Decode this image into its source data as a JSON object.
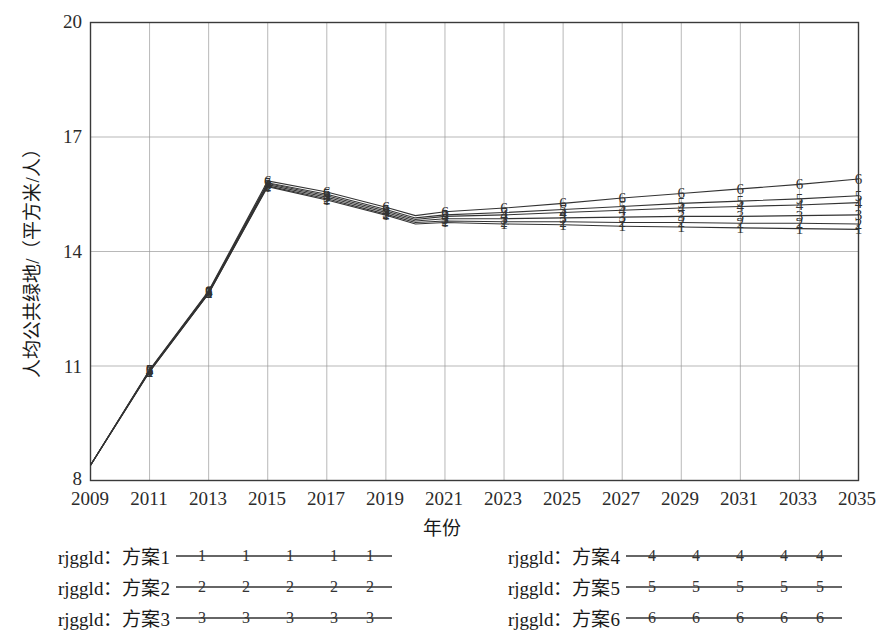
{
  "axes": {
    "ylabel": "人均公共绿地/（平方米/人）",
    "xlabel": "年份",
    "yticks": [
      "8",
      "11",
      "14",
      "17",
      "20"
    ],
    "xticks": [
      "2009",
      "2011",
      "2013",
      "2015",
      "2017",
      "2019",
      "2021",
      "2023",
      "2025",
      "2027",
      "2029",
      "2031",
      "2033",
      "2035"
    ]
  },
  "legend": {
    "left": [
      {
        "text": "rjggld：方案1",
        "marker": "1"
      },
      {
        "text": "rjggld：方案2",
        "marker": "2"
      },
      {
        "text": "rjggld：方案3",
        "marker": "3"
      }
    ],
    "right": [
      {
        "text": "rjggld：方案4",
        "marker": "4"
      },
      {
        "text": "rjggld：方案5",
        "marker": "5"
      },
      {
        "text": "rjggld：方案6",
        "marker": "6"
      }
    ]
  },
  "chart_data": {
    "type": "line",
    "title": "",
    "xlabel": "年份",
    "ylabel": "人均公共绿地/（平方米/人）",
    "xlim": [
      2009,
      2035
    ],
    "ylim": [
      8,
      20
    ],
    "yticks": [
      8,
      11,
      14,
      17,
      20
    ],
    "grid": true,
    "legend_position": "below",
    "marker_style": "series-number-glyph",
    "color": "#333333",
    "x": [
      2009,
      2011,
      2013,
      2015,
      2017,
      2019,
      2020,
      2021,
      2023,
      2025,
      2027,
      2029,
      2031,
      2033,
      2035
    ],
    "series": [
      {
        "name": "rjggld：方案1",
        "marker": "1",
        "values": [
          8.4,
          10.85,
          12.9,
          15.7,
          15.35,
          14.95,
          14.72,
          14.76,
          14.72,
          14.7,
          14.66,
          14.64,
          14.62,
          14.6,
          14.58
        ]
      },
      {
        "name": "rjggld：方案2",
        "marker": "2",
        "values": [
          8.4,
          10.85,
          12.9,
          15.72,
          15.38,
          14.98,
          14.76,
          14.8,
          14.78,
          14.78,
          14.76,
          14.76,
          14.74,
          14.74,
          14.72
        ]
      },
      {
        "name": "rjggld：方案3",
        "marker": "3",
        "values": [
          8.4,
          10.87,
          12.92,
          15.75,
          15.42,
          15.02,
          14.8,
          14.86,
          14.86,
          14.88,
          14.9,
          14.92,
          14.92,
          14.94,
          14.96
        ]
      },
      {
        "name": "rjggld：方案4",
        "marker": "4",
        "values": [
          8.4,
          10.88,
          12.94,
          15.78,
          15.46,
          15.06,
          14.84,
          14.92,
          14.96,
          15.02,
          15.08,
          15.14,
          15.18,
          15.22,
          15.28
        ]
      },
      {
        "name": "rjggld：方案5",
        "marker": "5",
        "values": [
          8.4,
          10.89,
          12.95,
          15.8,
          15.5,
          15.1,
          14.88,
          14.96,
          15.02,
          15.1,
          15.18,
          15.26,
          15.32,
          15.38,
          15.46
        ]
      },
      {
        "name": "rjggld：方案6",
        "marker": "6",
        "values": [
          8.4,
          10.9,
          12.97,
          15.85,
          15.56,
          15.16,
          14.94,
          15.04,
          15.14,
          15.26,
          15.4,
          15.52,
          15.64,
          15.76,
          15.9
        ]
      }
    ]
  }
}
